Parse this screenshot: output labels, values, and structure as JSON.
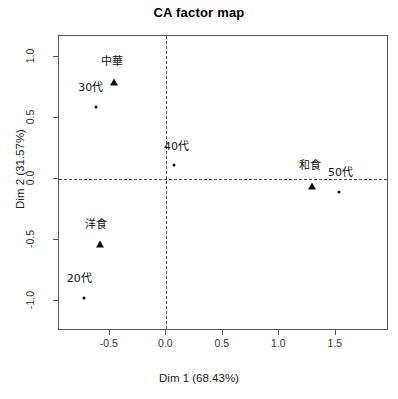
{
  "chart_data": {
    "type": "scatter",
    "title": "CA factor map",
    "xlabel": "Dim 1 (68.43%)",
    "ylabel": "Dim 2 (31.57%)",
    "xlim": [
      -0.95,
      1.97
    ],
    "ylim": [
      -1.25,
      1.17
    ],
    "xticks": [
      "-0.5",
      "0.0",
      "0.5",
      "1.0",
      "1.5"
    ],
    "xtick_values": [
      -0.5,
      0.0,
      0.5,
      1.0,
      1.5
    ],
    "yticks": [
      "1.0",
      "0.5",
      "0.0",
      "-0.5",
      "-1.0"
    ],
    "ytick_values": [
      1.0,
      0.5,
      0.0,
      -0.5,
      -1.0
    ],
    "grid": false,
    "legend": "none",
    "zero_lines": {
      "x": 0.0,
      "y": 0.0,
      "style": "dashed"
    },
    "series": [
      {
        "name": "columns",
        "marker": "triangle",
        "points": [
          {
            "label": "中華",
            "x": -0.46,
            "y": 0.79,
            "label_dx": -0.02,
            "label_dy": 0.13
          },
          {
            "label": "和食",
            "x": 1.29,
            "y": -0.06,
            "label_dx": -0.02,
            "label_dy": 0.13
          },
          {
            "label": "洋食",
            "x": -0.59,
            "y": -0.54,
            "label_dx": -0.03,
            "label_dy": 0.13
          }
        ]
      },
      {
        "name": "rows",
        "marker": "dot",
        "points": [
          {
            "label": "30代",
            "x": -0.62,
            "y": 0.59,
            "label_dx": -0.05,
            "label_dy": 0.12
          },
          {
            "label": "40代",
            "x": 0.07,
            "y": 0.11,
            "label_dx": 0.02,
            "label_dy": 0.12
          },
          {
            "label": "50代",
            "x": 1.53,
            "y": -0.11,
            "label_dx": 0.01,
            "label_dy": 0.12
          },
          {
            "label": "20代",
            "x": -0.73,
            "y": -0.98,
            "label_dx": -0.04,
            "label_dy": 0.12
          }
        ]
      }
    ]
  },
  "colors": {
    "frame": "#555555",
    "marker": "#111111",
    "zero_line": "#4a4a4a",
    "background": "#ffffff"
  }
}
